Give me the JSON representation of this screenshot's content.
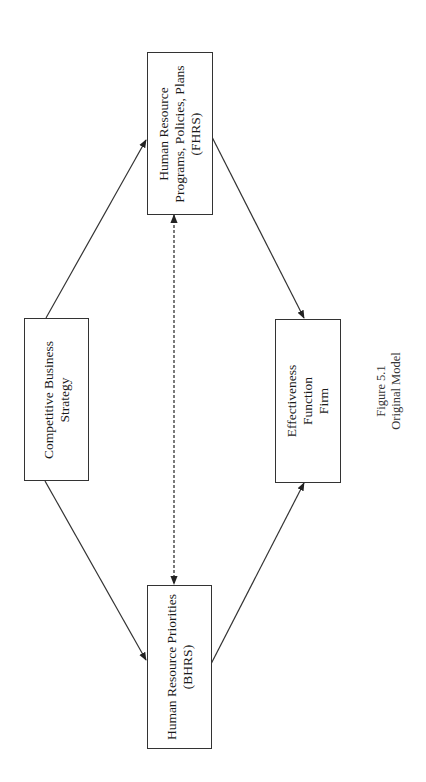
{
  "figure": {
    "caption": {
      "line1": "Figure 5.1",
      "line2": "Original Model"
    },
    "orientation": "rotated 90 degrees counter-clockwise"
  },
  "nodes": {
    "strategy": {
      "lines": [
        "Competitive Business",
        "Strategy"
      ]
    },
    "fhrs": {
      "lines": [
        "Human Resource",
        "Programs, Policies, Plans",
        "(FHRS)"
      ]
    },
    "bhrs": {
      "lines": [
        "Human Resource Priorities",
        "(BHRS)"
      ]
    },
    "effectiveness": {
      "lines": [
        "Effectiveness",
        "Function",
        "Firm"
      ]
    }
  },
  "edges": [
    {
      "from": "Competitive Business Strategy",
      "to": "Human Resource Programs, Policies, Plans (FHRS)",
      "style": "solid"
    },
    {
      "from": "Competitive Business Strategy",
      "to": "Human Resource Priorities (BHRS)",
      "style": "solid"
    },
    {
      "from": "Human Resource Programs, Policies, Plans (FHRS)",
      "to": "Effectiveness Function Firm",
      "style": "solid"
    },
    {
      "from": "Human Resource Priorities (BHRS)",
      "to": "Effectiveness Function Firm",
      "style": "solid"
    },
    {
      "from": "Human Resource Programs, Policies, Plans (FHRS)",
      "to": "Human Resource Priorities (BHRS)",
      "style": "dashed-bidirectional"
    }
  ],
  "colors": {
    "line": "#333333",
    "background": "#ffffff"
  }
}
